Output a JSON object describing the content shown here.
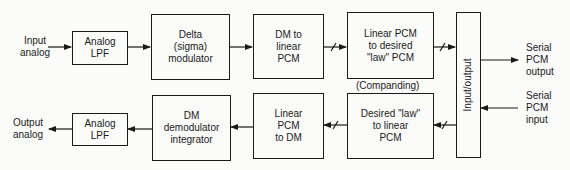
{
  "diagram": {
    "type": "block-diagram",
    "inputs": {
      "input_analog": "Input\nanalog",
      "output_analog": "Output\nanalog",
      "serial_pcm_output": "Serial\nPCM\noutput",
      "serial_pcm_input": "Serial\nPCM\ninput"
    },
    "blocks": {
      "analog_lpf_top": "Analog\nLPF",
      "delta_modulator": "Delta\n(sigma)\nmodulator",
      "dm_to_linear_pcm": "DM to\nlinear\nPCM",
      "linear_to_law_pcm": "Linear PCM\nto desired\n\"law\" PCM",
      "io_block": "Input/output",
      "law_to_linear_pcm": "Desired \"law\"\nto linear\nPCM",
      "linear_pcm_to_dm": "Linear\nPCM\nto DM",
      "dm_demodulator": "DM\ndemodulator\nintegrator",
      "analog_lpf_bottom": "Analog\nLPF"
    },
    "annotation_companding": "(Companding)",
    "connections": [
      {
        "from": "Input analog",
        "to": "Analog LPF"
      },
      {
        "from": "Analog LPF",
        "to": "Delta (sigma) modulator"
      },
      {
        "from": "Delta (sigma) modulator",
        "to": "DM to linear PCM"
      },
      {
        "from": "DM to linear PCM",
        "to": "Linear PCM to desired \"law\" PCM",
        "bus": true
      },
      {
        "from": "Linear PCM to desired \"law\" PCM",
        "to": "Input/output",
        "bus": true
      },
      {
        "from": "Input/output",
        "to": "Serial PCM output"
      },
      {
        "from": "Serial PCM input",
        "to": "Input/output"
      },
      {
        "from": "Input/output",
        "to": "Desired \"law\" to linear PCM",
        "bus": true
      },
      {
        "from": "Desired \"law\" to linear PCM",
        "to": "Linear PCM to DM",
        "bus": true
      },
      {
        "from": "Linear PCM to DM",
        "to": "DM demodulator integrator"
      },
      {
        "from": "DM demodulator integrator",
        "to": "Analog LPF"
      },
      {
        "from": "Analog LPF",
        "to": "Output analog"
      }
    ]
  }
}
